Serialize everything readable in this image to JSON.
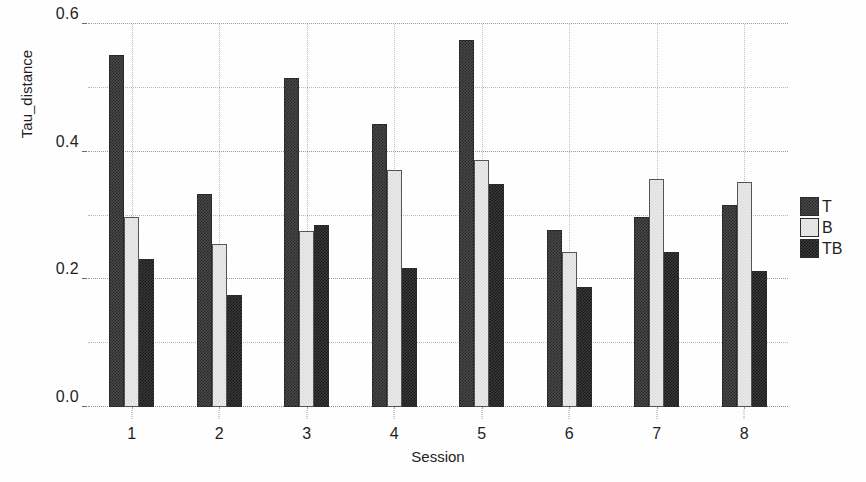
{
  "chart_data": {
    "type": "bar",
    "title": "",
    "xlabel": "Session",
    "ylabel": "Tau_distance",
    "categories": [
      "1",
      "2",
      "3",
      "4",
      "5",
      "6",
      "7",
      "8"
    ],
    "series": [
      {
        "name": "T",
        "values": [
          0.551,
          0.333,
          0.515,
          0.443,
          0.575,
          0.278,
          0.297,
          0.317
        ]
      },
      {
        "name": "B",
        "values": [
          0.297,
          0.255,
          0.275,
          0.372,
          0.387,
          0.243,
          0.357,
          0.352
        ]
      },
      {
        "name": "TB",
        "values": [
          0.232,
          0.175,
          0.285,
          0.218,
          0.35,
          0.188,
          0.243,
          0.213
        ]
      }
    ],
    "ylim": [
      0.0,
      0.6
    ],
    "ytick_labels": [
      "0.0",
      "0.2",
      "0.4",
      "0.6"
    ],
    "ytick_values": [
      0.0,
      0.2,
      0.4,
      0.6
    ],
    "minor_gridline_values": [
      0.1,
      0.3,
      0.5
    ],
    "grid": true,
    "legend_position": "right",
    "legend_entries": [
      "T",
      "B",
      "TB"
    ],
    "colors": {
      "T": "#4a4a4a",
      "B": "#ececec",
      "TB": "#3a3a3a",
      "grid": "#b9b9b9",
      "axis": "#1f1f1f",
      "background": "#fefefe"
    }
  }
}
